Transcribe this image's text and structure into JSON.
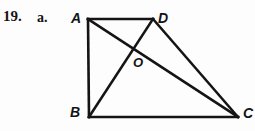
{
  "problem": {
    "number": "19.",
    "part": "a."
  },
  "figure": {
    "type": "geometry-diagram",
    "stroke_color": "#141414",
    "background_color": "#fdfdfd",
    "stroke_width": 2.6,
    "vertices": [
      {
        "name": "A",
        "x": 88,
        "y": 19,
        "label": "A",
        "label_x": 71,
        "label_y": 11
      },
      {
        "name": "D",
        "x": 153,
        "y": 19,
        "label": "D",
        "label_x": 158,
        "label_y": 11
      },
      {
        "name": "B",
        "x": 89,
        "y": 117,
        "label": "B",
        "label_x": 70,
        "label_y": 105
      },
      {
        "name": "C",
        "x": 238,
        "y": 117,
        "label": "C",
        "label_x": 243,
        "label_y": 106
      }
    ],
    "intersection": {
      "name": "O",
      "x": 131,
      "y": 55,
      "label": "O",
      "label_x": 133,
      "label_y": 56
    },
    "segments": [
      {
        "name": "AD",
        "from": "A",
        "to": "D"
      },
      {
        "name": "AB",
        "from": "A",
        "to": "B"
      },
      {
        "name": "BC",
        "from": "B",
        "to": "C"
      },
      {
        "name": "DC",
        "from": "D",
        "to": "C"
      },
      {
        "name": "AC",
        "from": "A",
        "to": "C"
      },
      {
        "name": "BD",
        "from": "B",
        "to": "D"
      }
    ]
  }
}
